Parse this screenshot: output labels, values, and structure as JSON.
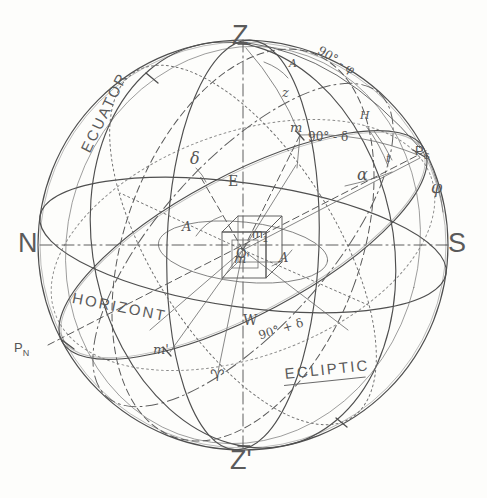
{
  "figure": {
    "background_color": "#fdfdfb",
    "ink_color": "#4a4a4a"
  },
  "cardinal_points": [
    {
      "id": "zenith",
      "label": "Z",
      "meaning": "zenith",
      "x": 242,
      "y": 38
    },
    {
      "id": "nadir",
      "label": "Z'",
      "meaning": "nadir",
      "x": 242,
      "y": 463
    },
    {
      "id": "north",
      "label": "N",
      "meaning": "north point",
      "x": 32,
      "y": 245
    },
    {
      "id": "south",
      "label": "S",
      "meaning": "south point",
      "x": 455,
      "y": 245
    },
    {
      "id": "east",
      "label": "E",
      "meaning": "east point",
      "x": 233,
      "y": 182
    },
    {
      "id": "west",
      "label": "W",
      "meaning": "west point",
      "x": 248,
      "y": 321
    }
  ],
  "poles": [
    {
      "id": "pole-south",
      "label": "P",
      "sub": "S",
      "meaning": "south celestial pole",
      "x": 419,
      "y": 152
    },
    {
      "id": "pole-north",
      "label": "P",
      "sub": "N",
      "meaning": "north celestial pole",
      "x": 22,
      "y": 349
    }
  ],
  "star_markers": [
    {
      "id": "star-m",
      "label": "m",
      "meaning": "star position",
      "x": 294,
      "y": 129
    },
    {
      "id": "star-m-sub1",
      "label": "m",
      "sub": "1",
      "meaning": "star projection on equator",
      "x": 255,
      "y": 234
    },
    {
      "id": "star-m-prime",
      "label": "m'",
      "meaning": "star projection on horizon",
      "x": 238,
      "y": 259
    },
    {
      "id": "star-m-prime2",
      "label": "m'",
      "meaning": "horizon foot point",
      "x": 158,
      "y": 351
    },
    {
      "id": "origin-o",
      "label": "O",
      "meaning": "observer / sphere centre",
      "x": 240,
      "y": 254
    }
  ],
  "angle_labels": [
    {
      "id": "azimuth-A-top",
      "label": "A",
      "meaning": "azimuth angle at zenith",
      "x": 293,
      "y": 65
    },
    {
      "id": "azimuth-A-left",
      "label": "A",
      "meaning": "azimuth arc on horizon",
      "x": 186,
      "y": 228
    },
    {
      "id": "azimuth-A-right",
      "label": "A",
      "meaning": "azimuth arc near centre",
      "x": 283,
      "y": 259
    },
    {
      "id": "zenith-distance-z",
      "label": "z",
      "meaning": "zenith distance",
      "x": 286,
      "y": 94
    },
    {
      "id": "hour-angle-H",
      "label": "H",
      "meaning": "hour angle",
      "x": 364,
      "y": 118
    },
    {
      "id": "hour-angle-t",
      "label": "t",
      "meaning": "hour angle t",
      "x": 389,
      "y": 161
    },
    {
      "id": "right-ascension",
      "label": "α",
      "meaning": "right ascension",
      "x": 362,
      "y": 176
    },
    {
      "id": "declination-delta",
      "label": "δ",
      "meaning": "declination",
      "x": 195,
      "y": 160
    },
    {
      "id": "latitude-phi",
      "label": "φ",
      "meaning": "observer latitude",
      "x": 436,
      "y": 190
    }
  ],
  "arc_labels": [
    {
      "id": "colatitude",
      "label": "90° - φ",
      "meaning": "colatitude arc",
      "x": 330,
      "y": 48
    },
    {
      "id": "polar-distance",
      "label": "90° - δ",
      "meaning": "polar distance arc",
      "x": 313,
      "y": 138
    },
    {
      "id": "polar-distance-2",
      "label": "90° + δ",
      "meaning": "lower polar distance",
      "x": 262,
      "y": 334
    }
  ],
  "great_circles": [
    {
      "id": "equator",
      "label": "ECUATOR",
      "x": 78,
      "y": 144
    },
    {
      "id": "horizon",
      "label": "HORIZONT",
      "x": 78,
      "y": 296
    },
    {
      "id": "ecliptic",
      "label": "ECLIPTIC",
      "x": 290,
      "y": 373
    }
  ],
  "vernal_equinox": {
    "id": "aries",
    "label": "♈",
    "meaning": "vernal equinox point",
    "x": 216,
    "y": 377
  }
}
